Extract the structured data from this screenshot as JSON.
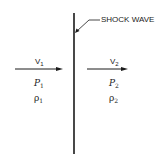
{
  "diagram": {
    "title_label": "SHOCK WAVE",
    "upstream": {
      "velocity": {
        "symbol": "V",
        "subscript": "1"
      },
      "pressure": {
        "symbol": "P",
        "subscript": "1"
      },
      "density": {
        "symbol": "ρ",
        "subscript": "1"
      }
    },
    "downstream": {
      "velocity": {
        "symbol": "V",
        "subscript": "2"
      },
      "pressure": {
        "symbol": "P",
        "subscript": "2"
      },
      "density": {
        "symbol": "ρ",
        "subscript": "2"
      }
    }
  }
}
